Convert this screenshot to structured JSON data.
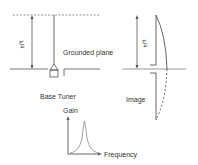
{
  "diagram": {
    "left": {
      "wavelength_label": "λ/4",
      "plane_label": "Grounded plane",
      "tuner_label": "Base Tuner"
    },
    "right": {
      "wavelength_label": "λ/4",
      "image_label": "Image"
    },
    "graph": {
      "y_label": "Gain",
      "x_label": "Frequency"
    }
  },
  "colors": {
    "line": "#555555",
    "ground": "#999999",
    "text": "#333333"
  }
}
